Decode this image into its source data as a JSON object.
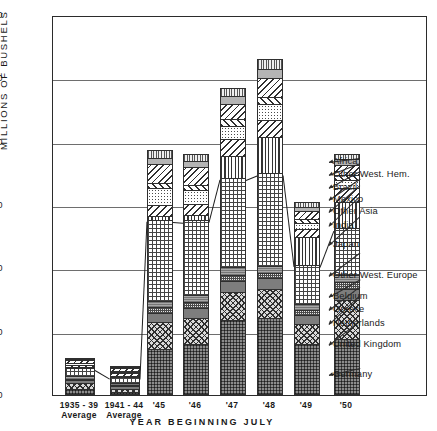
{
  "chart_data": {
    "type": "bar",
    "stacked": true,
    "title": "",
    "xlabel": "YEAR BEGINNING JULY",
    "ylabel": "MILLIONS OF BUSHELS",
    "ylim": [
      0,
      600
    ],
    "yticks": [
      0,
      100,
      200,
      300,
      400,
      500,
      600
    ],
    "grid": true,
    "legend_position": "right",
    "categories": [
      "1935 - 39\nAverage",
      "1941 - 44\nAverage",
      "'45",
      "'46",
      "'47",
      "'48",
      "'49",
      "'50"
    ],
    "category_labels": [
      {
        "line1": "1935 - 39",
        "line2": "Average"
      },
      {
        "line1": "1941 - 44",
        "line2": "Average"
      },
      {
        "line1": "'45",
        "line2": ""
      },
      {
        "line1": "'46",
        "line2": ""
      },
      {
        "line1": "'47",
        "line2": ""
      },
      {
        "line1": "'48",
        "line2": ""
      },
      {
        "line1": "'49",
        "line2": ""
      },
      {
        "line1": "'50",
        "line2": ""
      }
    ],
    "series": [
      {
        "name": "Germany",
        "pattern": "p-germany",
        "values": [
          10,
          4,
          72,
          80,
          118,
          122,
          80,
          88
        ]
      },
      {
        "name": "United Kingdom",
        "pattern": "p-uk",
        "values": [
          9,
          6,
          44,
          42,
          44,
          46,
          32,
          62
        ]
      },
      {
        "name": "Netherlands",
        "pattern": "p-neth",
        "values": [
          5,
          4,
          14,
          16,
          18,
          16,
          14,
          18
        ]
      },
      {
        "name": "Greece",
        "pattern": "p-greece",
        "values": [
          2,
          2,
          9,
          9,
          10,
          9,
          8,
          10
        ]
      },
      {
        "name": "Belgium",
        "pattern": "p-belgium",
        "values": [
          4,
          3,
          10,
          11,
          12,
          11,
          9,
          12
        ]
      },
      {
        "name": "Other West. Europe",
        "pattern": "p-owe",
        "values": [
          12,
          9,
          128,
          118,
          141,
          146,
          62,
          73
        ]
      },
      {
        "name": "Japan",
        "pattern": "p-japan",
        "values": [
          2,
          2,
          6,
          8,
          34,
          58,
          44,
          42
        ]
      },
      {
        "name": "India",
        "pattern": "p-india",
        "values": [
          3,
          4,
          17,
          18,
          27,
          27,
          13,
          22
        ]
      },
      {
        "name": "Other Asia",
        "pattern": "p-oasia",
        "values": [
          3,
          3,
          27,
          22,
          21,
          24,
          10,
          12
        ]
      },
      {
        "name": "Mexico",
        "pattern": "p-mexico",
        "values": [
          1,
          1,
          8,
          8,
          11,
          12,
          6,
          8
        ]
      },
      {
        "name": "Brazil",
        "pattern": "p-brazil",
        "values": [
          4,
          4,
          30,
          28,
          24,
          30,
          12,
          16
        ]
      },
      {
        "name": "Other West. Hem.",
        "pattern": "p-owh",
        "values": [
          2,
          2,
          10,
          10,
          12,
          14,
          7,
          9
        ]
      },
      {
        "name": "Africa",
        "pattern": "p-africa",
        "values": [
          2,
          2,
          12,
          10,
          12,
          15,
          7,
          8
        ]
      }
    ],
    "totals": [
      59,
      46,
      387,
      380,
      484,
      530,
      304,
      380
    ]
  },
  "yaxis": {
    "label": "MILLIONS OF BUSHELS",
    "ticks": [
      "600",
      "500",
      "400",
      "300",
      "200",
      "100",
      "0"
    ]
  },
  "xaxis": {
    "title": "YEAR BEGINNING JULY",
    "ticks": [
      {
        "line1": "1935 - 39",
        "line2": "Average"
      },
      {
        "line1": "1941 - 44",
        "line2": "Average"
      },
      {
        "line1": "'45",
        "line2": ""
      },
      {
        "line1": "'46",
        "line2": ""
      },
      {
        "line1": "'47",
        "line2": ""
      },
      {
        "line1": "'48",
        "line2": ""
      },
      {
        "line1": "'49",
        "line2": ""
      },
      {
        "line1": "'50",
        "line2": ""
      }
    ]
  },
  "legend": {
    "items": [
      {
        "label": "Africa"
      },
      {
        "label": "Other West. Hem."
      },
      {
        "label": "Brazil"
      },
      {
        "label": "Mexico"
      },
      {
        "label": "Other Asia"
      },
      {
        "label": "India"
      },
      {
        "label": "Japan"
      },
      {
        "label": "Other West. Europe"
      },
      {
        "label": "Belgium"
      },
      {
        "label": "Greece"
      },
      {
        "label": "Netherlands"
      },
      {
        "label": "United Kingdom"
      },
      {
        "label": "Germany"
      }
    ]
  },
  "colors": {
    "axis": "#2b2b2b",
    "grid": "#6e6e6e",
    "background": "#ffffff",
    "ink": "#1a1a1a"
  }
}
